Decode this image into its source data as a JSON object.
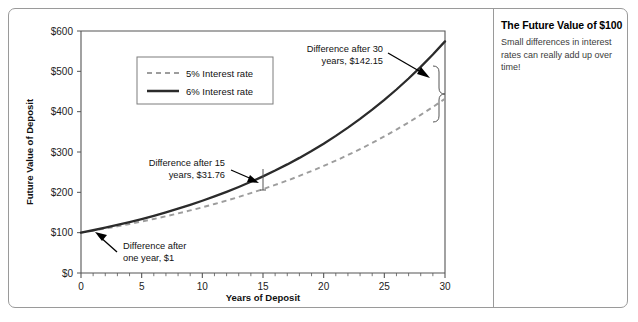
{
  "side_panel": {
    "title": "The Future Value of $100",
    "body": "Small differences in interest rates can really add up over time!"
  },
  "chart_data": {
    "type": "line",
    "title": "The Future Value of $100",
    "xlabel": "Years of Deposit",
    "ylabel": "Future Value of Deposit",
    "xlim": [
      0,
      30
    ],
    "ylim": [
      0,
      600
    ],
    "xticks": [
      0,
      5,
      10,
      15,
      20,
      25,
      30
    ],
    "xtick_labels": [
      "0",
      "5",
      "10",
      "15",
      "20",
      "25",
      "30"
    ],
    "x_minor_tick_step": 1,
    "yticks": [
      0,
      100,
      200,
      300,
      400,
      500,
      600
    ],
    "ytick_labels": [
      "$0",
      "$100",
      "$200",
      "$300",
      "$400",
      "$500",
      "$600"
    ],
    "grid": false,
    "legend_position": "upper-left-inside",
    "x": [
      0,
      1,
      2,
      3,
      4,
      5,
      6,
      7,
      8,
      9,
      10,
      11,
      12,
      13,
      14,
      15,
      16,
      17,
      18,
      19,
      20,
      21,
      22,
      23,
      24,
      25,
      26,
      27,
      28,
      29,
      30
    ],
    "series": [
      {
        "name": "5% Interest rate",
        "style": "dashed",
        "color": "#9d9d9d",
        "values": [
          100.0,
          105.0,
          110.25,
          115.76,
          121.55,
          127.63,
          134.01,
          140.71,
          147.75,
          155.13,
          162.89,
          171.03,
          179.59,
          188.56,
          197.99,
          207.89,
          218.29,
          229.2,
          240.66,
          252.7,
          265.33,
          278.6,
          292.53,
          307.15,
          322.51,
          338.64,
          355.57,
          373.35,
          392.01,
          411.61,
          432.19
        ]
      },
      {
        "name": "6% Interest rate",
        "style": "solid",
        "color": "#2b2b2b",
        "values": [
          100.0,
          106.0,
          112.36,
          119.1,
          126.25,
          133.82,
          141.85,
          150.36,
          159.38,
          168.95,
          179.08,
          189.83,
          201.22,
          213.29,
          226.09,
          239.66,
          254.04,
          269.28,
          285.43,
          302.56,
          320.71,
          339.96,
          360.35,
          381.97,
          404.89,
          429.19,
          454.94,
          482.23,
          511.17,
          541.84,
          574.35
        ]
      }
    ],
    "annotations": [
      {
        "id": "diff-one-year",
        "text_lines": [
          "Difference after",
          "one year, $1"
        ],
        "value": 1.0,
        "at_year": 1,
        "arrow": "points-up-left-to-curve"
      },
      {
        "id": "diff-15-years",
        "text_lines": [
          "Difference after 15",
          "years, $31.76"
        ],
        "value": 31.76,
        "at_year": 15,
        "arrow": "points-down-right-to-gap"
      },
      {
        "id": "diff-30-years",
        "text_lines": [
          "Difference after 30",
          "years, $142.15"
        ],
        "value": 142.15,
        "at_year": 30,
        "arrow": "points-down-right-to-brace"
      }
    ]
  }
}
